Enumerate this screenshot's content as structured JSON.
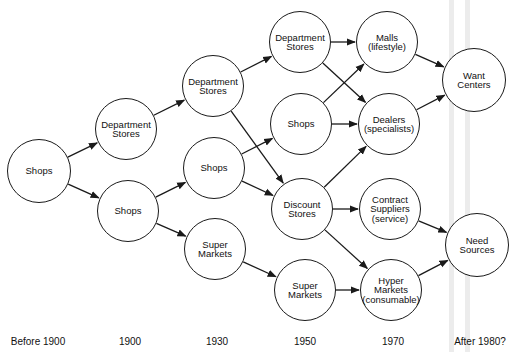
{
  "diagram": {
    "title": "",
    "timeline": [
      {
        "id": "t0",
        "label": "Before 1900",
        "x": 38
      },
      {
        "id": "t1",
        "label": "1900",
        "x": 130
      },
      {
        "id": "t2",
        "label": "1930",
        "x": 217
      },
      {
        "id": "t3",
        "label": "1950",
        "x": 305
      },
      {
        "id": "t4",
        "label": "1970",
        "x": 393
      },
      {
        "id": "t5",
        "label": "After 1980?",
        "x": 480
      }
    ],
    "nodes": [
      {
        "id": "shops0",
        "label": "Shops",
        "cx": 39,
        "cy": 171,
        "r": 32
      },
      {
        "id": "dept1900",
        "label": "Department\nStores",
        "cx": 126,
        "cy": 129,
        "r": 31
      },
      {
        "id": "shops1900",
        "label": "Shops",
        "cx": 128,
        "cy": 211,
        "r": 31
      },
      {
        "id": "dept1930",
        "label": "Department\nStores",
        "cx": 213,
        "cy": 86,
        "r": 31
      },
      {
        "id": "shops1930",
        "label": "Shops",
        "cx": 214,
        "cy": 168,
        "r": 31
      },
      {
        "id": "super1930",
        "label": "Super\nMarkets",
        "cx": 215,
        "cy": 249,
        "r": 31
      },
      {
        "id": "dept1950",
        "label": "Department\nStores",
        "cx": 300,
        "cy": 42,
        "r": 31
      },
      {
        "id": "shops1950",
        "label": "Shops",
        "cx": 301,
        "cy": 124,
        "r": 31
      },
      {
        "id": "discount1950",
        "label": "Discount\nStores",
        "cx": 302,
        "cy": 209,
        "r": 31
      },
      {
        "id": "super1950",
        "label": "Super\nMarkets",
        "cx": 305,
        "cy": 290,
        "r": 31
      },
      {
        "id": "malls1970",
        "label": "Malls\n(lifestyle)",
        "cx": 387,
        "cy": 42,
        "r": 31
      },
      {
        "id": "dealers1970",
        "label": "Dealers\n(specialists)",
        "cx": 389,
        "cy": 124,
        "r": 31
      },
      {
        "id": "contract1970",
        "label": "Contract\nSuppliers\n(service)",
        "cx": 390,
        "cy": 209,
        "r": 31
      },
      {
        "id": "hyper1970",
        "label": "Hyper\nMarkets\n(consumable)",
        "cx": 391,
        "cy": 290,
        "r": 31
      },
      {
        "id": "want",
        "label": "Want\nCenters",
        "cx": 474,
        "cy": 80,
        "r": 32
      },
      {
        "id": "need",
        "label": "Need\nSources",
        "cx": 477,
        "cy": 245,
        "r": 32
      }
    ],
    "edges": [
      {
        "from": "shops0",
        "to": "dept1900"
      },
      {
        "from": "shops0",
        "to": "shops1900"
      },
      {
        "from": "dept1900",
        "to": "dept1930"
      },
      {
        "from": "shops1900",
        "to": "shops1930"
      },
      {
        "from": "shops1900",
        "to": "super1930"
      },
      {
        "from": "dept1930",
        "to": "dept1950"
      },
      {
        "from": "dept1930",
        "to": "discount1950"
      },
      {
        "from": "shops1930",
        "to": "shops1950"
      },
      {
        "from": "shops1930",
        "to": "discount1950"
      },
      {
        "from": "super1930",
        "to": "super1950"
      },
      {
        "from": "dept1950",
        "to": "malls1970"
      },
      {
        "from": "dept1950",
        "to": "dealers1970"
      },
      {
        "from": "shops1950",
        "to": "malls1970"
      },
      {
        "from": "shops1950",
        "to": "dealers1970"
      },
      {
        "from": "discount1950",
        "to": "dealers1970"
      },
      {
        "from": "discount1950",
        "to": "contract1970"
      },
      {
        "from": "discount1950",
        "to": "hyper1970"
      },
      {
        "from": "super1950",
        "to": "hyper1970"
      },
      {
        "from": "malls1970",
        "to": "want"
      },
      {
        "from": "dealers1970",
        "to": "want"
      },
      {
        "from": "contract1970",
        "to": "need"
      },
      {
        "from": "hyper1970",
        "to": "need"
      }
    ],
    "colors": {
      "stroke": "#1a1a1a",
      "background": "#ffffff",
      "band": "#ececec"
    }
  }
}
